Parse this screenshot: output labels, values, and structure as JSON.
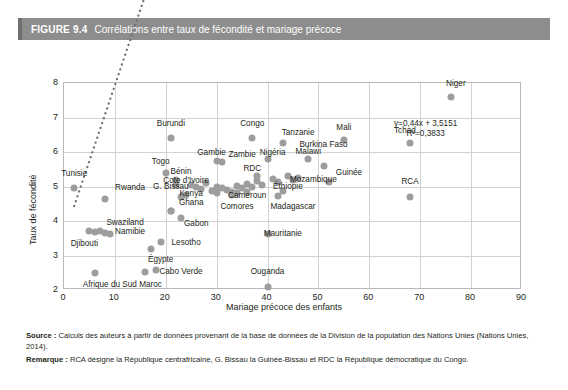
{
  "header": {
    "figure_number": "FIGURE 9.4",
    "title": "Corrélations entre taux de fécondité et mariage précoce"
  },
  "footer": {
    "source_label": "Source :",
    "source_text": " Calculs des auteurs à partir de données provenant de la base de données de la Division de la population des Nations Unies (Nations Unies, 2014).",
    "note_label": "Remarque :",
    "note_text": " RCA désigne la République centrafricaine, G. Bissau la Guinée-Bissau et RDC la République démocratique du Congo."
  },
  "colors": {
    "header_bar": "#8d8d8d",
    "header_text": "#ffffff",
    "point": "#9d9d9d",
    "grid": "#d2d2d2",
    "axis": "#b9b9b9",
    "text": "#231f20"
  },
  "chart_data": {
    "type": "scatter",
    "title": "Corrélations entre taux de fécondité et mariage précoce",
    "xlabel": "Mariage précoce des enfants",
    "ylabel": "Taux de fécondité",
    "xlim": [
      0,
      90
    ],
    "ylim": [
      2,
      8
    ],
    "xticks": [
      0,
      10,
      20,
      30,
      40,
      50,
      60,
      70,
      80,
      90
    ],
    "yticks": [
      2,
      3,
      4,
      5,
      6,
      7,
      8
    ],
    "grid": true,
    "legend": "none",
    "trendline": {
      "type": "linear-dotted",
      "slope": 0.44,
      "intercept": 3.5151,
      "equation": "y=0,44x + 3,5151",
      "r2_label": "R²=0,3833",
      "r2": 0.3833,
      "x_start": 2,
      "x_end": 75
    },
    "points": [
      {
        "label": "Tunisie",
        "x": 2,
        "y": 4.95,
        "lx": 2,
        "ly": 5.35,
        "anchor": "center"
      },
      {
        "label": "Rwanda",
        "x": 8,
        "y": 4.65,
        "lx": 13,
        "ly": 4.95,
        "anchor": "center"
      },
      {
        "label": "Djibouti",
        "x": 5,
        "y": 3.7,
        "lx": 4,
        "ly": 3.32,
        "anchor": "center"
      },
      {
        "label": "Swaziland",
        "x": 7,
        "y": 3.72,
        "lx": 12,
        "ly": 3.93,
        "anchor": "center"
      },
      {
        "label": "Namibie",
        "x": 8,
        "y": 3.65,
        "lx": 13,
        "ly": 3.68,
        "anchor": "center"
      },
      {
        "label": "Afrique du Sud",
        "x": 6,
        "y": 2.5,
        "lx": 9,
        "ly": 2.14,
        "anchor": "center"
      },
      {
        "label": "Maroc",
        "x": 16,
        "y": 2.52,
        "lx": 17,
        "ly": 2.15,
        "anchor": "center"
      },
      {
        "label": "Égypte",
        "x": 17,
        "y": 3.2,
        "lx": 19,
        "ly": 2.88,
        "anchor": "center"
      },
      {
        "label": "Cabo Verde",
        "x": 18,
        "y": 2.58,
        "lx": 23,
        "ly": 2.52,
        "anchor": "center"
      },
      {
        "label": "Lesotho",
        "x": 19,
        "y": 3.4,
        "lx": 24,
        "ly": 3.35,
        "anchor": "center"
      },
      {
        "label": "Togo",
        "x": 20,
        "y": 5.4,
        "lx": 19,
        "ly": 5.72,
        "anchor": "center"
      },
      {
        "label": "Burundi",
        "x": 21,
        "y": 6.4,
        "lx": 21,
        "ly": 6.8,
        "anchor": "center"
      },
      {
        "label": "G. Bissau",
        "x": 21,
        "y": 4.3,
        "lx": 21,
        "ly": 4.98,
        "anchor": "center"
      },
      {
        "label": "Ghana",
        "x": 21,
        "y": 4.3,
        "lx": 25,
        "ly": 4.52,
        "anchor": "center"
      },
      {
        "label": "Bénin",
        "x": 22,
        "y": 5.2,
        "lx": 23,
        "ly": 5.42,
        "anchor": "center"
      },
      {
        "label": "Cote d'Ivoire",
        "x": 22,
        "y": 5.05,
        "lx": 24,
        "ly": 5.15,
        "anchor": "center"
      },
      {
        "label": "Kenya",
        "x": 23,
        "y": 4.7,
        "lx": 25,
        "ly": 4.78,
        "anchor": "center"
      },
      {
        "label": "Gabon",
        "x": 23,
        "y": 4.1,
        "lx": 26,
        "ly": 3.92,
        "anchor": "center"
      },
      {
        "label": "Gambie",
        "x": 30,
        "y": 5.75,
        "lx": 29,
        "ly": 5.98,
        "anchor": "center"
      },
      {
        "label": "Zambie",
        "x": 31,
        "y": 5.72,
        "lx": 35,
        "ly": 5.92,
        "anchor": "center"
      },
      {
        "label": "Congo",
        "x": 37,
        "y": 6.4,
        "lx": 37,
        "ly": 6.82,
        "anchor": "center"
      },
      {
        "label": "RDC",
        "x": 38,
        "y": 5.3,
        "lx": 37,
        "ly": 5.52,
        "anchor": "center"
      },
      {
        "label": "Nigéria",
        "x": 40,
        "y": 5.8,
        "lx": 41,
        "ly": 5.98,
        "anchor": "center"
      },
      {
        "label": "Cameroun",
        "x": 33,
        "y": 4.85,
        "lx": 36,
        "ly": 4.72,
        "anchor": "center"
      },
      {
        "label": "Comores",
        "x": 33,
        "y": 4.75,
        "lx": 34,
        "ly": 4.42,
        "anchor": "center"
      },
      {
        "label": "Madagascar",
        "x": 42,
        "y": 4.72,
        "lx": 45,
        "ly": 4.42,
        "anchor": "center"
      },
      {
        "label": "Tanzanie",
        "x": 43,
        "y": 6.25,
        "lx": 46,
        "ly": 6.55,
        "anchor": "center"
      },
      {
        "label": "Éthiopie",
        "x": 43,
        "y": 4.88,
        "lx": 44,
        "ly": 5.0,
        "anchor": "center"
      },
      {
        "label": "Mozambique",
        "x": 45,
        "y": 5.18,
        "lx": 49,
        "ly": 5.2,
        "anchor": "center"
      },
      {
        "label": "Malawi",
        "x": 48,
        "y": 5.8,
        "lx": 48,
        "ly": 6.0,
        "anchor": "center"
      },
      {
        "label": "Burkina Faso",
        "x": 51,
        "y": 5.6,
        "lx": 51,
        "ly": 6.2,
        "anchor": "center"
      },
      {
        "label": "Guinée",
        "x": 52,
        "y": 5.12,
        "lx": 56,
        "ly": 5.38,
        "anchor": "center"
      },
      {
        "label": "Mauritanie",
        "x": 40,
        "y": 3.62,
        "lx": 43,
        "ly": 3.62,
        "anchor": "center"
      },
      {
        "label": "Ouganda",
        "x": 40,
        "y": 2.1,
        "lx": 40,
        "ly": 2.52,
        "anchor": "center"
      },
      {
        "label": "Mali",
        "x": 55,
        "y": 6.35,
        "lx": 55,
        "ly": 6.7,
        "anchor": "center"
      },
      {
        "label": "RCA",
        "x": 68,
        "y": 4.7,
        "lx": 68,
        "ly": 5.12,
        "anchor": "center"
      },
      {
        "label": "Tchad",
        "x": 68,
        "y": 6.25,
        "lx": 67,
        "ly": 6.62,
        "anchor": "center"
      },
      {
        "label": "Niger",
        "x": 76,
        "y": 7.58,
        "lx": 77,
        "ly": 7.98,
        "anchor": "center"
      }
    ],
    "extra_points": [
      {
        "x": 25,
        "y": 5.05
      },
      {
        "x": 26,
        "y": 4.98
      },
      {
        "x": 27,
        "y": 4.92
      },
      {
        "x": 28,
        "y": 5.1
      },
      {
        "x": 29,
        "y": 4.88
      },
      {
        "x": 30,
        "y": 5.0
      },
      {
        "x": 31,
        "y": 4.95
      },
      {
        "x": 32,
        "y": 4.9
      },
      {
        "x": 34,
        "y": 5.02
      },
      {
        "x": 35,
        "y": 4.95
      },
      {
        "x": 36,
        "y": 5.08
      },
      {
        "x": 37,
        "y": 4.98
      },
      {
        "x": 38,
        "y": 5.15
      },
      {
        "x": 39,
        "y": 5.05
      },
      {
        "x": 41,
        "y": 5.22
      },
      {
        "x": 42,
        "y": 5.12
      },
      {
        "x": 44,
        "y": 5.3
      },
      {
        "x": 46,
        "y": 5.25
      },
      {
        "x": 34,
        "y": 4.8
      },
      {
        "x": 36,
        "y": 4.85
      },
      {
        "x": 30,
        "y": 4.82
      },
      {
        "x": 24,
        "y": 4.75
      },
      {
        "x": 6,
        "y": 3.68
      },
      {
        "x": 9,
        "y": 3.62
      }
    ]
  }
}
